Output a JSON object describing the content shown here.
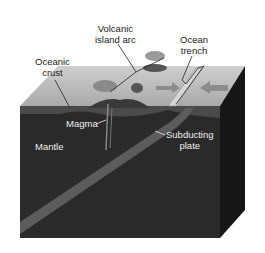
{
  "diagram": {
    "type": "block-diagram",
    "labels": {
      "volcanic_island_arc": {
        "line1": "Volcanic",
        "line2": "island arc"
      },
      "ocean_trench": {
        "line1": "Ocean",
        "line2": "trench"
      },
      "oceanic_crust": {
        "line1": "Oceanic",
        "line2": "crust"
      },
      "magma": "Magma",
      "mantle": "Mantle",
      "subducting_plate": {
        "line1": "Subducting",
        "line2": "plate"
      }
    },
    "colors": {
      "top_surface": "#bcbcbc",
      "front_face": "#2a2a2a",
      "side_face": "#161616",
      "crust_band": "#4a4a4a",
      "subducting_slab": "#5c5c5c",
      "label_dark": "#222222",
      "label_light": "#eeeeee"
    }
  }
}
